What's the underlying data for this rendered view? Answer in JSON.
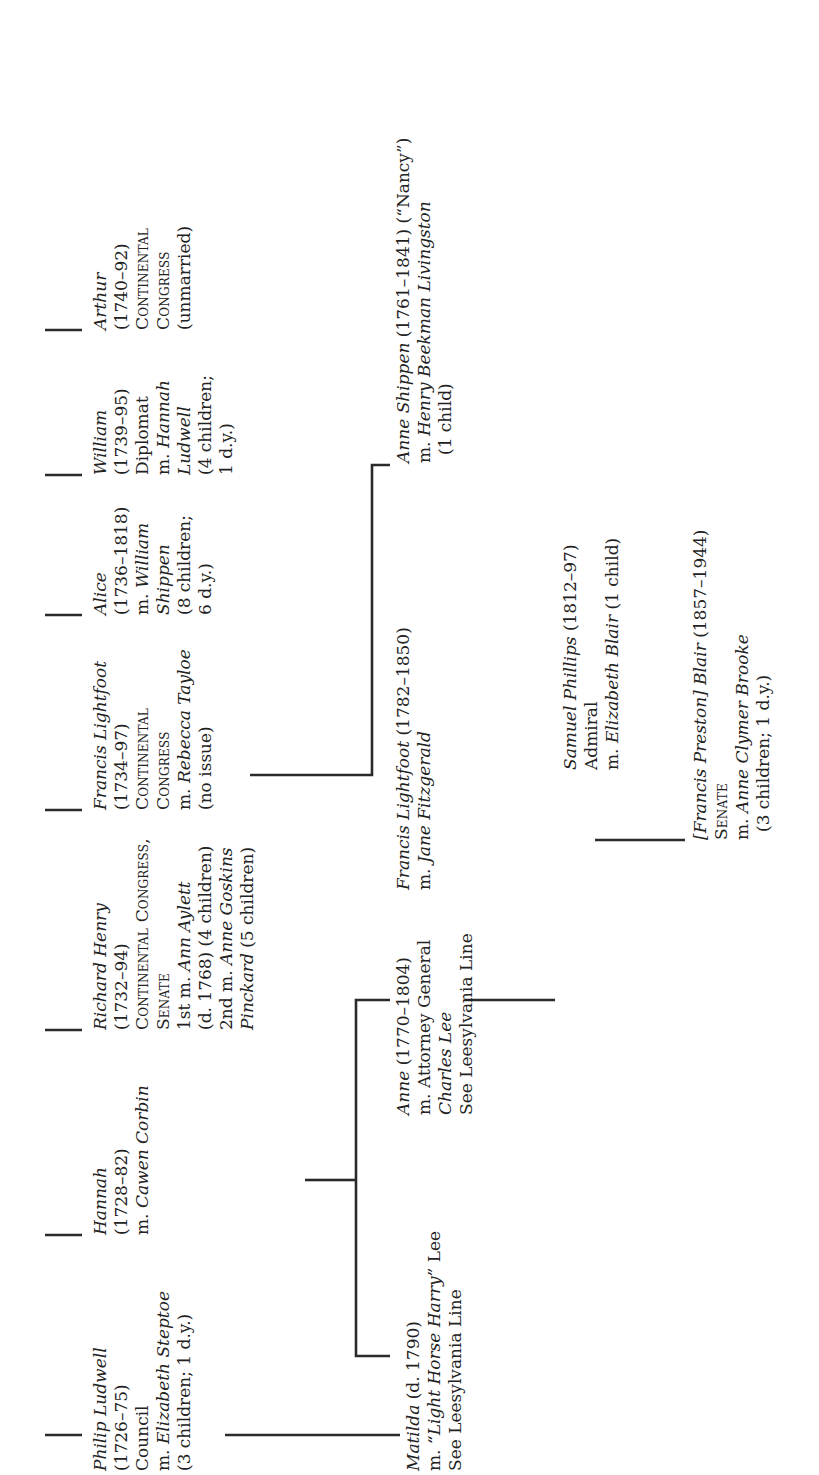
{
  "generation1": [
    {
      "name": "Philip Ludwell",
      "dates": "(1726–75)",
      "lines": [
        "Council",
        "m. Elizabeth Steptoe",
        "(3 children; 1 d.y.)"
      ]
    },
    {
      "name": "Hannah",
      "dates": "(1728–82)",
      "lines": [
        "m. Cawen Corbin"
      ]
    },
    {
      "name": "Richard Henry",
      "dates": "(1732–94)",
      "lines": [
        "Continental Congress,",
        "Senate",
        "1st m. Ann Aylett",
        "(d. 1768) (4 children)",
        "2nd m. Anne Goskins",
        "Pinckard (5 children)"
      ]
    },
    {
      "name": "Francis Lightfoot",
      "dates": "(1734–97)",
      "lines": [
        "Continental",
        "Congress",
        "m. Rebecca Tayloe",
        "(no issue)"
      ]
    },
    {
      "name": "Alice",
      "dates": "(1736–1818)",
      "lines": [
        "m. William",
        "Shippen",
        "(8 children;",
        "6 d.y.)"
      ]
    },
    {
      "name": "William",
      "dates": "(1739–95)",
      "lines": [
        "Diplomat",
        "m. Hannah",
        "Ludwell",
        "(4 children;",
        "1 d.y.)"
      ]
    },
    {
      "name": "Arthur",
      "dates": "(1740–92)",
      "lines": [
        "Continental",
        "Congress",
        "(unmarried)"
      ]
    }
  ],
  "generation2": {
    "matilda": {
      "name": "Matilda",
      "dates": "(d. 1790)",
      "lines": [
        "m. “Light Horse Harry” Lee",
        "See Leesylvania Line"
      ]
    },
    "anne": {
      "name": "Anne",
      "dates": "(1770–1804)",
      "lines": [
        "m. Attorney General",
        "Charles Lee",
        "See Leesylvania Line"
      ]
    },
    "francis_lightfoot": {
      "name": "Francis Lightfoot",
      "dates": "(1782–1850)",
      "lines": [
        "m. Jane Fitzgerald"
      ]
    },
    "anne_shippen": {
      "name": "Anne Shippen",
      "dates": "(1761–1841)",
      "nickname": "(“Nancy”)",
      "lines": [
        "m. Henry Beekman Livingston",
        "(1 child)"
      ]
    }
  },
  "generation3": {
    "samuel_phillips": {
      "name": "Samuel Phillips",
      "dates": "(1812–97)",
      "lines": [
        "Admiral",
        "m. Elizabeth Blair (1 child)"
      ]
    }
  },
  "generation4": {
    "francis_preston_blair": {
      "name": "[Francis Preston] Blair",
      "dates": "(1857–1944)",
      "lines": [
        "Senate",
        "m. Anne Clymer Brooke",
        "(3 children; 1 d.y.)"
      ]
    }
  }
}
